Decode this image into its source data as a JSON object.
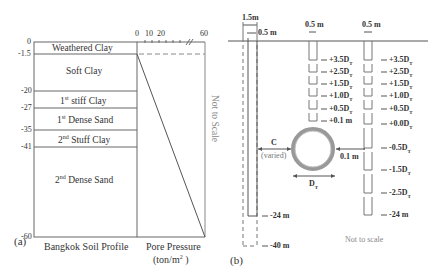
{
  "panel_a": {
    "label": "(a)",
    "depth_ticks": [
      "0",
      "-1.5",
      "-20",
      "-27",
      "-35",
      "-41",
      "-60"
    ],
    "layers": [
      {
        "name": "Weathered Clay",
        "top": "0",
        "bottom": "-1.5"
      },
      {
        "name": "Soft Clay",
        "top": "-1.5",
        "bottom": "-20"
      },
      {
        "name_prefix": "1",
        "sup": "st",
        "name_suffix": " stiff Clay",
        "top": "-20",
        "bottom": "-27"
      },
      {
        "name_prefix": "1",
        "sup": "st",
        "name_suffix": " Dense Sand",
        "top": "-27",
        "bottom": "-35"
      },
      {
        "name_prefix": "2",
        "sup": "nd",
        "name_suffix": " Stuff Clay",
        "top": "-35",
        "bottom": "-41"
      },
      {
        "name_prefix": "2",
        "sup": "nd",
        "name_suffix": " Dense Sand",
        "top": "-41",
        "bottom": "-60"
      }
    ],
    "profile_caption": "Bangkok Soil Profile",
    "pore_pressure": {
      "axis_ticks": [
        "0",
        "10",
        "20",
        "60"
      ],
      "caption_line1": "Pore Pressure",
      "caption_line2_prefix": "(ton/m",
      "caption_line2_sup": "2",
      "caption_line2_suffix": " )"
    },
    "note": "Not to Scale"
  },
  "panel_b": {
    "label": "(b)",
    "diaphragm_wall": {
      "width_label": "1.5m",
      "inner_width_label": "0.5 m",
      "depth_short": "-24 m",
      "depth_long": "-40 m"
    },
    "column1": {
      "width_label": "0.5 m",
      "levels": [
        "+3.5D",
        "+2.5D",
        "+1.5D",
        "+1.0D",
        "+0.5D",
        "+0.1 m"
      ],
      "level_subs": [
        "T",
        "T",
        "T",
        "T",
        "T",
        ""
      ]
    },
    "column2": {
      "width_label": "0.5 m",
      "levels": [
        "+3.5D",
        "+2.5D",
        "+1.5D",
        "+1.0D",
        "+0.5D",
        "+0.0D",
        "-0.5D",
        "-1.5D",
        "-2.5D",
        "-24 m"
      ],
      "level_subs": [
        "T",
        "T",
        "T",
        "T",
        "T",
        "T",
        "T",
        "T",
        "T",
        ""
      ]
    },
    "tunnel": {
      "clearance_label": "C",
      "clearance_sub": "(varied)",
      "gap_label": "0.1 m",
      "diameter_label": "D",
      "diameter_sub": "T"
    },
    "note": "Not to scale"
  }
}
